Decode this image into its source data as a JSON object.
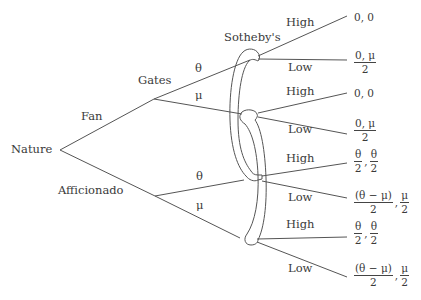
{
  "diagram": {
    "type": "extensive-form game tree",
    "root": {
      "label": "Nature"
    },
    "nature_branches": [
      {
        "label": "Fan",
        "player": "Gates"
      },
      {
        "label": "Afficionado",
        "player": ""
      }
    ],
    "player_labels": {
      "first_mover": "Gates",
      "second_mover": "Sotheby's"
    },
    "gates_actions": {
      "upper": "θ",
      "lower": "μ"
    },
    "afficionado_actions": {
      "upper": "θ",
      "lower": "μ"
    },
    "sotheby_actions": [
      "High",
      "Low",
      "High",
      "Low",
      "High",
      "Low",
      "High",
      "Low"
    ],
    "payoffs": [
      {
        "type": "plain",
        "text": "0, 0"
      },
      {
        "type": "frac1",
        "num": "0, μ",
        "den": "2"
      },
      {
        "type": "plain",
        "text": "0, 0"
      },
      {
        "type": "frac1",
        "num": "0, μ",
        "den": "2"
      },
      {
        "type": "frac2",
        "a_num": "θ",
        "a_den": "2",
        "sep": ",",
        "b_num": "θ",
        "b_den": "2"
      },
      {
        "type": "frac2",
        "a_num": "(θ − μ)",
        "a_den": "2",
        "sep": ",",
        "b_num": "μ",
        "b_den": "2"
      },
      {
        "type": "frac2",
        "a_num": "θ",
        "a_den": "2",
        "sep": ",",
        "b_num": "θ",
        "b_den": "2"
      },
      {
        "type": "frac2",
        "a_num": "(θ − μ)",
        "a_den": "2",
        "sep": ",",
        "b_num": "μ",
        "b_den": "2"
      }
    ],
    "information_sets": 2,
    "line_color": "#555555"
  }
}
